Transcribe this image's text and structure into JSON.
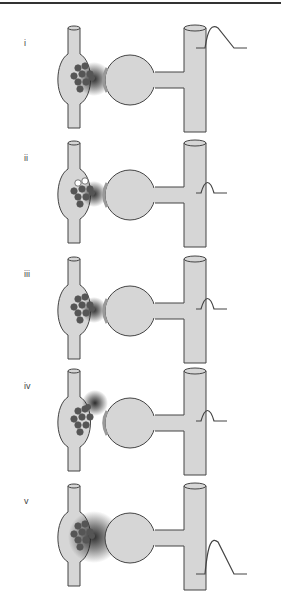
{
  "figure": {
    "colors": {
      "fill": "#d6d6d6",
      "stroke": "#444444",
      "vesicle": "#555555",
      "transmitter": "#222222",
      "background": "#ffffff"
    },
    "panels": [
      {
        "label": "i",
        "top": 24,
        "cloud": "front",
        "cloud_size": "medium",
        "vesicle_docked": true,
        "empty_vesicles": 0,
        "response": "large",
        "psd_shade": true
      },
      {
        "label": "ii",
        "top": 139,
        "cloud": "front",
        "cloud_size": "small",
        "vesicle_docked": true,
        "empty_vesicles": 2,
        "response": "small",
        "psd_shade": true
      },
      {
        "label": "iii",
        "top": 255,
        "cloud": "front",
        "cloud_size": "small",
        "vesicle_docked": true,
        "empty_vesicles": 0,
        "response": "small",
        "psd_shade": true
      },
      {
        "label": "iv",
        "top": 367,
        "cloud": "top",
        "cloud_size": "small",
        "vesicle_docked": true,
        "empty_vesicles": 0,
        "response": "small",
        "psd_shade": true
      },
      {
        "label": "v",
        "top": 482,
        "cloud": "front",
        "cloud_size": "large",
        "vesicle_docked": true,
        "empty_vesicles": 0,
        "response": "large",
        "psd_shade": false
      }
    ]
  }
}
